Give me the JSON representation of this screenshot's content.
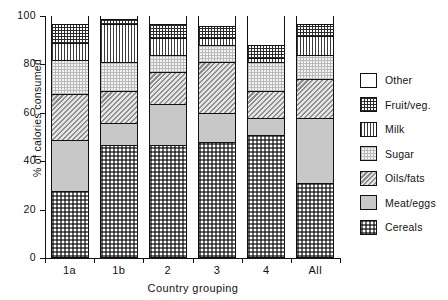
{
  "chart_data": {
    "type": "bar",
    "subtype": "stacked-bar-100",
    "title": "",
    "xlabel": "Country grouping",
    "ylabel": "% of calories consumed",
    "categories": [
      "1a",
      "1b",
      "2",
      "3",
      "4",
      "All"
    ],
    "ylim": [
      0,
      100
    ],
    "yticks": [
      0,
      20,
      40,
      60,
      80,
      100
    ],
    "ytick_labels": [
      "0",
      "20",
      "40",
      "60",
      "80",
      "100"
    ],
    "grid": false,
    "legend_position": "right",
    "stack_order_bottom_to_top": [
      "Cereals",
      "Meat/eggs",
      "Oils/fats",
      "Sugar",
      "Milk",
      "Fruit/veg.",
      "Other"
    ],
    "series": [
      {
        "name": "Cereals",
        "values": [
          27,
          46,
          46,
          47,
          50,
          30
        ]
      },
      {
        "name": "Meat/eggs",
        "values": [
          21,
          9,
          17,
          12,
          7,
          27
        ]
      },
      {
        "name": "Oils/fats",
        "values": [
          19,
          13,
          13,
          21,
          11,
          16
        ]
      },
      {
        "name": "Sugar",
        "values": [
          14,
          12,
          7,
          7,
          12,
          10
        ]
      },
      {
        "name": "Milk",
        "values": [
          7,
          16,
          7,
          3,
          2,
          8
        ]
      },
      {
        "name": "Fruit/veg.",
        "values": [
          8,
          2,
          6,
          5,
          5,
          5
        ]
      },
      {
        "name": "Other",
        "values": [
          4,
          2,
          4,
          5,
          13,
          4
        ]
      }
    ]
  },
  "legend": {
    "entries": [
      {
        "label": "Other",
        "pattern": "p-other"
      },
      {
        "label": "Fruit/veg.",
        "pattern": "p-fruit"
      },
      {
        "label": "Milk",
        "pattern": "p-milk"
      },
      {
        "label": "Sugar",
        "pattern": "p-sugar"
      },
      {
        "label": "Oils/fats",
        "pattern": "p-oils"
      },
      {
        "label": "Meat/eggs",
        "pattern": "p-meat"
      },
      {
        "label": "Cereals",
        "pattern": "p-cereals"
      }
    ]
  },
  "axes": {
    "y_title": "% of calories consumed",
    "x_title": "Country grouping"
  }
}
